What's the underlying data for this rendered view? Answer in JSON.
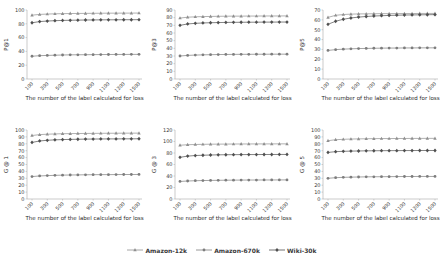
{
  "figure": {
    "x_axis_title": "The number of the label calculated for loss",
    "x_ticks": [
      100,
      300,
      500,
      700,
      900,
      1100,
      1300,
      1500
    ],
    "text_color": "#3a3a3a",
    "axis_color": "#a8a8a8",
    "legend": [
      {
        "label": "Amazon-12k",
        "marker": "triangle",
        "color": "#8f8f8f"
      },
      {
        "label": "Amazon-670k",
        "marker": "circle",
        "color": "#7d7d7d"
      },
      {
        "label": "Wiki-30k",
        "marker": "diamond",
        "color": "#4f4f4f"
      }
    ]
  },
  "chart_data": [
    {
      "type": "line",
      "title": "",
      "ylabel": "P@1",
      "xlabel": "The number of the label calculated for loss",
      "ylim": [
        0,
        100
      ],
      "yticks": [
        0,
        20,
        40,
        60,
        80,
        100
      ],
      "grid": false,
      "legend_position": "figure-bottom",
      "x": [
        100,
        200,
        300,
        400,
        500,
        600,
        700,
        800,
        900,
        1000,
        1100,
        1200,
        1300,
        1400,
        1500
      ],
      "series": [
        {
          "name": "Amazon-12k",
          "values": [
            92.5,
            93.6,
            94.1,
            94.5,
            94.7,
            94.9,
            95.0,
            95.1,
            95.2,
            95.3,
            95.4,
            95.4,
            95.5,
            95.5,
            95.6
          ]
        },
        {
          "name": "Amazon-670k",
          "values": [
            33.0,
            33.8,
            34.2,
            34.5,
            34.8,
            35.0,
            35.1,
            35.2,
            35.3,
            35.4,
            35.5,
            35.6,
            35.6,
            35.7,
            35.7
          ]
        },
        {
          "name": "Wiki-30k",
          "values": [
            81.5,
            83.2,
            84.0,
            84.5,
            84.9,
            85.1,
            85.3,
            85.5,
            85.6,
            85.7,
            85.8,
            85.8,
            85.9,
            85.9,
            86.0
          ]
        }
      ]
    },
    {
      "type": "line",
      "title": "",
      "ylabel": "P@3",
      "xlabel": "The number of the label calculated for loss",
      "ylim": [
        0,
        90
      ],
      "yticks": [
        0,
        10,
        20,
        30,
        40,
        50,
        60,
        70,
        80,
        90
      ],
      "grid": false,
      "legend_position": "figure-bottom",
      "x": [
        100,
        200,
        300,
        400,
        500,
        600,
        700,
        800,
        900,
        1000,
        1100,
        1200,
        1300,
        1400,
        1500
      ],
      "series": [
        {
          "name": "Amazon-12k",
          "values": [
            79.5,
            80.6,
            81.1,
            81.4,
            81.6,
            81.8,
            81.9,
            82.0,
            82.0,
            82.1,
            82.1,
            82.2,
            82.2,
            82.2,
            82.3
          ]
        },
        {
          "name": "Amazon-670k",
          "values": [
            30.0,
            30.8,
            31.2,
            31.5,
            31.7,
            31.9,
            32.0,
            32.1,
            32.2,
            32.2,
            32.3,
            32.3,
            32.4,
            32.4,
            32.4
          ]
        },
        {
          "name": "Wiki-30k",
          "values": [
            70.0,
            71.8,
            72.6,
            73.1,
            73.4,
            73.6,
            73.8,
            73.9,
            74.0,
            74.1,
            74.1,
            74.2,
            74.2,
            74.3,
            74.3
          ]
        }
      ]
    },
    {
      "type": "line",
      "title": "",
      "ylabel": "P@5",
      "xlabel": "The number of the label calculated for loss",
      "ylim": [
        0,
        70
      ],
      "yticks": [
        0,
        10,
        20,
        30,
        40,
        50,
        60,
        70
      ],
      "grid": false,
      "legend_position": "figure-bottom",
      "x": [
        100,
        200,
        300,
        400,
        500,
        600,
        700,
        800,
        900,
        1000,
        1100,
        1200,
        1300,
        1400,
        1500
      ],
      "series": [
        {
          "name": "Amazon-12k",
          "values": [
            62.5,
            64.6,
            65.4,
            65.8,
            66.0,
            66.1,
            66.2,
            66.3,
            66.3,
            66.4,
            66.4,
            66.4,
            66.5,
            66.5,
            66.5
          ]
        },
        {
          "name": "Amazon-670k",
          "values": [
            29.0,
            29.8,
            30.3,
            30.6,
            30.9,
            31.0,
            31.2,
            31.3,
            31.4,
            31.4,
            31.5,
            31.5,
            31.6,
            31.6,
            31.6
          ]
        },
        {
          "name": "Wiki-30k",
          "values": [
            55.5,
            58.6,
            60.6,
            61.9,
            62.8,
            63.4,
            63.9,
            64.2,
            64.5,
            64.7,
            64.9,
            65.0,
            65.1,
            65.2,
            65.3
          ]
        }
      ]
    },
    {
      "type": "line",
      "title": "",
      "ylabel": "G @ 1",
      "xlabel": "The number of the label calculated for loss",
      "ylim": [
        0,
        100
      ],
      "yticks": [
        0,
        10,
        20,
        30,
        40,
        50,
        60,
        70,
        80,
        90,
        100
      ],
      "grid": false,
      "legend_position": "figure-bottom",
      "x": [
        100,
        200,
        300,
        400,
        500,
        600,
        700,
        800,
        900,
        1000,
        1100,
        1200,
        1300,
        1400,
        1500
      ],
      "series": [
        {
          "name": "Amazon-12k",
          "values": [
            92.0,
            93.3,
            93.9,
            94.3,
            94.6,
            94.8,
            94.9,
            95.0,
            95.1,
            95.2,
            95.3,
            95.3,
            95.4,
            95.4,
            95.5
          ]
        },
        {
          "name": "Amazon-670k",
          "values": [
            32.5,
            33.4,
            33.9,
            34.3,
            34.6,
            34.8,
            34.9,
            35.1,
            35.2,
            35.3,
            35.3,
            35.4,
            35.5,
            35.5,
            35.6
          ]
        },
        {
          "name": "Wiki-30k",
          "values": [
            82.0,
            84.1,
            85.1,
            85.7,
            86.1,
            86.4,
            86.6,
            86.8,
            86.9,
            87.0,
            87.1,
            87.1,
            87.2,
            87.2,
            87.3
          ]
        }
      ]
    },
    {
      "type": "line",
      "title": "",
      "ylabel": "G @ 3",
      "xlabel": "The number of the label calculated for loss",
      "ylim": [
        0,
        120
      ],
      "yticks": [
        0,
        20,
        40,
        60,
        80,
        100,
        120
      ],
      "grid": false,
      "legend_position": "figure-bottom",
      "x": [
        100,
        200,
        300,
        400,
        500,
        600,
        700,
        800,
        900,
        1000,
        1100,
        1200,
        1300,
        1400,
        1500
      ],
      "series": [
        {
          "name": "Amazon-12k",
          "values": [
            93.5,
            94.4,
            94.8,
            95.1,
            95.3,
            95.4,
            95.5,
            95.6,
            95.7,
            95.7,
            95.8,
            95.8,
            95.8,
            95.9,
            95.9
          ]
        },
        {
          "name": "Amazon-670k",
          "values": [
            30.5,
            31.3,
            31.8,
            32.1,
            32.3,
            32.5,
            32.7,
            32.8,
            32.9,
            33.0,
            33.0,
            33.1,
            33.1,
            33.2,
            33.2
          ]
        },
        {
          "name": "Wiki-30k",
          "values": [
            72.5,
            74.6,
            75.6,
            76.1,
            76.5,
            76.8,
            77.0,
            77.1,
            77.2,
            77.3,
            77.3,
            77.4,
            77.4,
            77.5,
            77.5
          ]
        }
      ]
    },
    {
      "type": "line",
      "title": "",
      "ylabel": "G @ 5",
      "xlabel": "The number of the label calculated for loss",
      "ylim": [
        0,
        100
      ],
      "yticks": [
        0,
        10,
        20,
        30,
        40,
        50,
        60,
        70,
        80,
        90,
        100
      ],
      "grid": false,
      "legend_position": "figure-bottom",
      "x": [
        100,
        200,
        300,
        400,
        500,
        600,
        700,
        800,
        900,
        1000,
        1100,
        1200,
        1300,
        1400,
        1500
      ],
      "series": [
        {
          "name": "Amazon-12k",
          "values": [
            84.5,
            85.9,
            86.5,
            86.9,
            87.1,
            87.3,
            87.5,
            87.6,
            87.6,
            87.7,
            87.7,
            87.8,
            87.8,
            87.9,
            87.9
          ]
        },
        {
          "name": "Amazon-670k",
          "values": [
            30.0,
            30.9,
            31.4,
            31.7,
            31.9,
            32.1,
            32.2,
            32.3,
            32.4,
            32.5,
            32.6,
            32.6,
            32.7,
            32.7,
            32.7
          ]
        },
        {
          "name": "Wiki-30k",
          "values": [
            67.5,
            68.6,
            69.1,
            69.4,
            69.6,
            69.8,
            69.9,
            70.0,
            70.1,
            70.1,
            70.2,
            70.2,
            70.3,
            70.3,
            70.3
          ]
        }
      ]
    }
  ]
}
